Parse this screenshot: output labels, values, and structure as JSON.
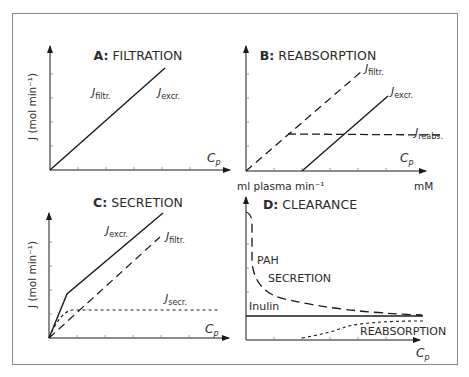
{
  "figure": {
    "panels": [
      {
        "id": "A",
        "letter": "A:",
        "title": "FILTRATION"
      },
      {
        "id": "B",
        "letter": "B:",
        "title": "REABSORPTION"
      },
      {
        "id": "C",
        "letter": "C:",
        "title": "SECRETION"
      },
      {
        "id": "D",
        "letter": "D:",
        "title": "CLEARANCE"
      }
    ],
    "y_axis_label_top": "J (mol min⁻¹)",
    "y_axis_label_bottom": "J (mol min⁻¹)",
    "clearance_y_label": "ml plasma min⁻¹",
    "conc_unit_label": "mM",
    "x_axis_symbol": "C",
    "x_axis_subscript": "p",
    "curve_labels": {
      "A": {
        "filtr": {
          "main": "J",
          "sub": "filtr."
        },
        "excr": {
          "main": "J",
          "sub": "excr."
        }
      },
      "B": {
        "filtr": {
          "main": "J",
          "sub": "filtr."
        },
        "excr": {
          "main": "J",
          "sub": "excr."
        },
        "reabs": {
          "main": "J",
          "sub": "reabs."
        }
      },
      "C": {
        "excr": {
          "main": "J",
          "sub": "excr."
        },
        "filtr": {
          "main": "J",
          "sub": "filtr."
        },
        "secr": {
          "main": "J",
          "sub": "secr."
        }
      },
      "D": {
        "pah": "PAH",
        "secretion": "SECRETION",
        "inulin": "Inulin",
        "reabsorption": "REABSORPTION"
      }
    }
  },
  "colors": {
    "line": "#1a1a1a",
    "frame": "#8a8a8a",
    "text": "#2a2a2a"
  }
}
